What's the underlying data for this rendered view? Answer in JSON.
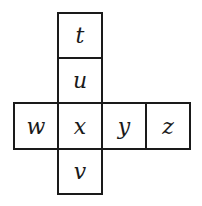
{
  "diagram": {
    "type": "cube-net",
    "cells": [
      {
        "label": "t",
        "row": 0,
        "col": 1
      },
      {
        "label": "u",
        "row": 1,
        "col": 1
      },
      {
        "label": "w",
        "row": 2,
        "col": 0
      },
      {
        "label": "x",
        "row": 2,
        "col": 1
      },
      {
        "label": "y",
        "row": 2,
        "col": 2
      },
      {
        "label": "z",
        "row": 2,
        "col": 3
      },
      {
        "label": "v",
        "row": 3,
        "col": 1
      }
    ],
    "colors": {
      "line": "#1a1a1a",
      "background": "#ffffff"
    }
  }
}
